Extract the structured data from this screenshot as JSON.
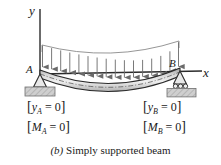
{
  "figure": {
    "caption_label": "(b)",
    "caption_text": "Simply supported beam",
    "axes": {
      "y_label": "y",
      "x_label": "x"
    },
    "supports": [
      {
        "id": "A",
        "label": "A",
        "type": "pin-support",
        "x": 40,
        "y": 74
      },
      {
        "id": "B",
        "label": "B",
        "type": "roller-support",
        "x": 180,
        "y": 74
      }
    ],
    "boundary_conditions": {
      "left": [
        {
          "open": "[",
          "var": "y",
          "sub": "A",
          "op": " = 0",
          "close": "]"
        },
        {
          "open": "[",
          "var": "M",
          "sub": "A",
          "op": " = 0",
          "close": "]"
        }
      ],
      "right": [
        {
          "open": "[",
          "var": "y",
          "sub": "B",
          "op": " = 0",
          "close": "]"
        },
        {
          "open": "[",
          "var": "M",
          "sub": "B",
          "op": " = 0",
          "close": "]"
        }
      ]
    },
    "load": {
      "type": "distributed-load",
      "arrow_count": 16,
      "direction": "down"
    },
    "colors": {
      "line": "#2b2b2b",
      "beam_fill": "#bcbcbc",
      "beam_fill_light": "#dcdcdc",
      "hatch_block": "#c9c9c9",
      "background": "#ffffff"
    }
  }
}
